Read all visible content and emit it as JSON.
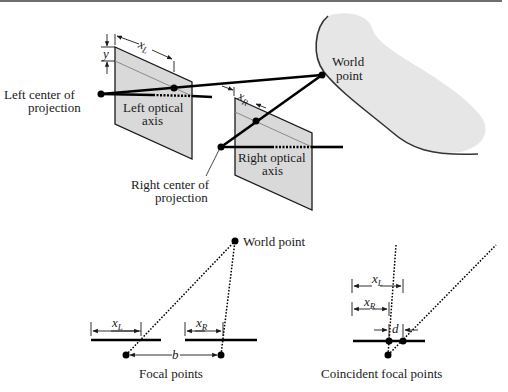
{
  "colors": {
    "plane_fill": "#d9d9d9",
    "plane_stroke": "#1a1a1a",
    "blob_fill": "#e6e6e6",
    "line": "#000000",
    "top_border": "#6e6e6e"
  },
  "top_diagram": {
    "labels": {
      "left_center": [
        "Left center of",
        "projection"
      ],
      "left_axis": [
        "Left optical",
        "axis"
      ],
      "right_center": [
        "Right center of",
        "projection"
      ],
      "right_axis": [
        "Right optical",
        "axis"
      ],
      "world_point": [
        "World",
        "point"
      ],
      "y": "y",
      "xL_main": "x",
      "xL_sub": "L",
      "xR_main": "x",
      "xR_sub": "R"
    }
  },
  "focal_diagram": {
    "caption": "Focal points",
    "world_point": "World point",
    "xL_main": "x",
    "xL_sub": "L",
    "xR_main": "x",
    "xR_sub": "R",
    "baseline": "b"
  },
  "coincident_diagram": {
    "caption": "Coincident focal points",
    "xL_main": "x",
    "xL_sub": "L",
    "xR_main": "x",
    "xR_sub": "R",
    "disparity": "d"
  }
}
